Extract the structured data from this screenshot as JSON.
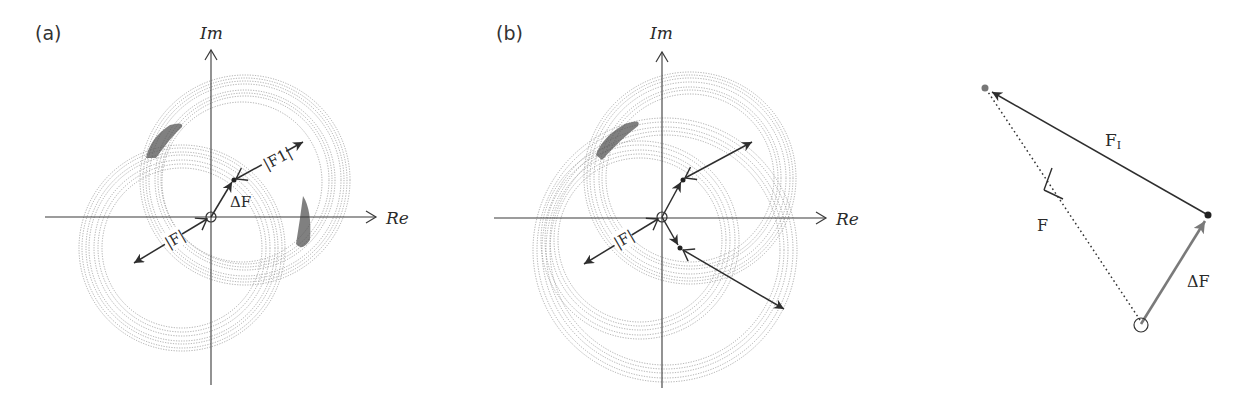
{
  "figure": {
    "panels": [
      {
        "id": "a",
        "tag": "(a)",
        "x_axis_label": "Re",
        "y_axis_label": "Im",
        "labels": {
          "delta_f": "ΔF",
          "f_abs": "|F|",
          "f1_abs": "|F1|"
        }
      },
      {
        "id": "b",
        "tag": "(b)",
        "x_axis_label": "Re",
        "y_axis_label": "Im",
        "labels": {
          "f_abs": "|F|"
        }
      },
      {
        "id": "vector-triangle",
        "labels": {
          "f_i": "F",
          "f_i_sub": "I",
          "f": "F",
          "delta_f": "ΔF"
        }
      }
    ],
    "colors": {
      "axis": "#3a3a3a",
      "rings": "#8a8a8a",
      "vector_dark": "#2e2e2e",
      "vector_gray": "#7a7a7a",
      "blob": "#4a4a4a"
    }
  }
}
